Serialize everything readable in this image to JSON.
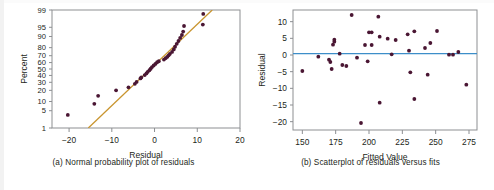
{
  "figure": {
    "background": "#ffffff",
    "point_color": "#4a1633",
    "frame_color": "#8d8f92",
    "text_color": "#231f20"
  },
  "chart_data": [
    {
      "type": "scatter",
      "panel_id": "a",
      "title": "",
      "caption": "(a) Normal probability plot of residuals",
      "xlabel": "Residual",
      "ylabel": "Percent",
      "xlim": [
        -24,
        20
      ],
      "ylim_percent": [
        1,
        99
      ],
      "yscale": "normal-probability",
      "grid": false,
      "legend": null,
      "xticks": [
        -20,
        -10,
        0,
        10,
        20
      ],
      "xticklabels": [
        "−20",
        "−10",
        "0",
        "10",
        "20"
      ],
      "yticks": [
        1,
        5,
        10,
        20,
        30,
        40,
        50,
        60,
        70,
        80,
        90,
        95,
        99
      ],
      "yticklabels": [
        "1",
        "5",
        "10",
        "20",
        "30",
        "40",
        "50",
        "60",
        "70",
        "80",
        "90",
        "95",
        "99"
      ],
      "reference_line": {
        "color": "#c9952f",
        "x_start": -15.5,
        "y_start": 1,
        "x_end": 13.5,
        "y_end": 99
      },
      "points": [
        {
          "x": -20.3,
          "p": 3.5
        },
        {
          "x": -14.1,
          "p": 8.5
        },
        {
          "x": -13.2,
          "p": 14.5
        },
        {
          "x": -9.0,
          "p": 20.0
        },
        {
          "x": -6.1,
          "p": 23.5
        },
        {
          "x": -4.6,
          "p": 28.0
        },
        {
          "x": -4.2,
          "p": 30.5
        },
        {
          "x": -3.3,
          "p": 35.5
        },
        {
          "x": -3.1,
          "p": 37.0
        },
        {
          "x": -2.3,
          "p": 40.5
        },
        {
          "x": -1.9,
          "p": 43.0
        },
        {
          "x": -1.6,
          "p": 45.5
        },
        {
          "x": -1.2,
          "p": 48.0
        },
        {
          "x": -0.9,
          "p": 50.5
        },
        {
          "x": -0.6,
          "p": 53.0
        },
        {
          "x": -0.2,
          "p": 55.5
        },
        {
          "x": 0.2,
          "p": 58.0
        },
        {
          "x": 0.6,
          "p": 60.5
        },
        {
          "x": 1.0,
          "p": 62.0
        },
        {
          "x": 2.2,
          "p": 64.5
        },
        {
          "x": 2.6,
          "p": 66.5
        },
        {
          "x": 3.0,
          "p": 68.5
        },
        {
          "x": 3.3,
          "p": 70.5
        },
        {
          "x": 3.6,
          "p": 72.5
        },
        {
          "x": 4.1,
          "p": 75.0
        },
        {
          "x": 4.5,
          "p": 78.0
        },
        {
          "x": 4.8,
          "p": 81.0
        },
        {
          "x": 5.2,
          "p": 84.0
        },
        {
          "x": 5.6,
          "p": 86.5
        },
        {
          "x": 6.0,
          "p": 89.0
        },
        {
          "x": 6.4,
          "p": 91.0
        },
        {
          "x": 6.7,
          "p": 93.0
        },
        {
          "x": 6.9,
          "p": 95.5
        },
        {
          "x": 11.3,
          "p": 96.0
        },
        {
          "x": 11.4,
          "p": 98.5
        }
      ]
    },
    {
      "type": "scatter",
      "panel_id": "b",
      "title": "",
      "caption": "(b) Scatterplot of residuals versus fits",
      "xlabel": "Fitted Value",
      "ylabel": "Residual",
      "xlim": [
        143,
        281
      ],
      "ylim": [
        -22.5,
        13.5
      ],
      "grid": false,
      "legend": null,
      "xticks": [
        150,
        175,
        200,
        225,
        250,
        275
      ],
      "xticklabels": [
        "150",
        "175",
        "200",
        "225",
        "250",
        "275"
      ],
      "yticks": [
        10,
        5,
        0,
        -5,
        -10,
        -15,
        -20
      ],
      "yticklabels": [
        "10",
        "5",
        "0",
        "−5",
        "−10",
        "−15",
        "−20"
      ],
      "reference_line": {
        "color": "#3d8ec9",
        "y": 0.4,
        "orientation": "horizontal"
      },
      "points": [
        {
          "x": 150,
          "y": -4.8
        },
        {
          "x": 162,
          "y": -0.5
        },
        {
          "x": 170,
          "y": -1.4
        },
        {
          "x": 171,
          "y": -2.1
        },
        {
          "x": 172,
          "y": -4.2
        },
        {
          "x": 173,
          "y": 3.1
        },
        {
          "x": 174,
          "y": 4.6
        },
        {
          "x": 174,
          "y": 4.0
        },
        {
          "x": 178,
          "y": 0.4
        },
        {
          "x": 180,
          "y": -3.0
        },
        {
          "x": 183,
          "y": -3.3
        },
        {
          "x": 187,
          "y": 12.0
        },
        {
          "x": 191,
          "y": -0.8
        },
        {
          "x": 194,
          "y": -20.4
        },
        {
          "x": 197,
          "y": 3.0
        },
        {
          "x": 199,
          "y": -1.9
        },
        {
          "x": 200,
          "y": 6.8
        },
        {
          "x": 202,
          "y": 6.8
        },
        {
          "x": 202,
          "y": 3.0
        },
        {
          "x": 207,
          "y": 11.5
        },
        {
          "x": 208,
          "y": 5.5
        },
        {
          "x": 208,
          "y": -14.3
        },
        {
          "x": 214,
          "y": 4.9
        },
        {
          "x": 217,
          "y": 0.2
        },
        {
          "x": 220,
          "y": 4.5
        },
        {
          "x": 229,
          "y": 6.2
        },
        {
          "x": 230,
          "y": 1.3
        },
        {
          "x": 231,
          "y": -5.2
        },
        {
          "x": 234,
          "y": 7.1
        },
        {
          "x": 234,
          "y": -13.2
        },
        {
          "x": 242,
          "y": 2.1
        },
        {
          "x": 244,
          "y": -5.9
        },
        {
          "x": 246,
          "y": 3.6
        },
        {
          "x": 251,
          "y": 7.2
        },
        {
          "x": 260,
          "y": 0.1
        },
        {
          "x": 263,
          "y": 0.1
        },
        {
          "x": 267,
          "y": 0.9
        },
        {
          "x": 273,
          "y": -8.9
        }
      ]
    }
  ]
}
